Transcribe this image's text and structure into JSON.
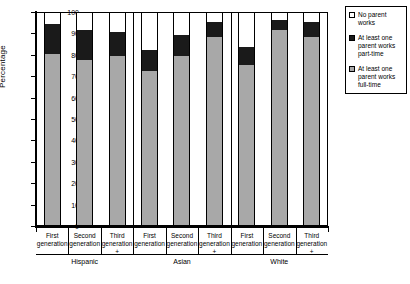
{
  "chart_data": {
    "type": "bar",
    "title": "",
    "subtitle": "",
    "xlabel": "",
    "ylabel": "Percentage",
    "ylim": [
      0,
      100
    ],
    "ytick_labels": [
      "0",
      "10",
      "20",
      "30",
      "40",
      "50",
      "60",
      "70",
      "80",
      "90",
      "100"
    ],
    "yticks": [
      0,
      10,
      20,
      30,
      40,
      50,
      60,
      70,
      80,
      90,
      100
    ],
    "grid": false,
    "stacked": true,
    "legend_position": "right",
    "groups": [
      "Hispanic",
      "Asian",
      "White"
    ],
    "categories": [
      "First generation",
      "Second generation",
      "Third generation +",
      "First generation",
      "Second generation",
      "Third generation +",
      "First generation",
      "Second generation",
      "Third generation +"
    ],
    "category_lines": [
      {
        "line1": "First",
        "line2": "generation",
        "plus": ""
      },
      {
        "line1": "Second",
        "line2": "generation",
        "plus": ""
      },
      {
        "line1": "Third",
        "line2": "generation",
        "plus": "+"
      },
      {
        "line1": "First",
        "line2": "generation",
        "plus": ""
      },
      {
        "line1": "Second",
        "line2": "generation",
        "plus": ""
      },
      {
        "line1": "Third",
        "line2": "generation",
        "plus": "+"
      },
      {
        "line1": "First",
        "line2": "generation",
        "plus": ""
      },
      {
        "line1": "Second",
        "line2": "generation",
        "plus": ""
      },
      {
        "line1": "Third",
        "line2": "generation",
        "plus": "+"
      }
    ],
    "series": [
      {
        "name": "At least one parent works full-time",
        "color": "#a8a8a8",
        "values": [
          80,
          77,
          79,
          72,
          79,
          88,
          75,
          91,
          88
        ]
      },
      {
        "name": "At least one parent works part-time",
        "color": "#1a1a1a",
        "values": [
          14,
          14,
          11,
          10,
          10,
          7,
          8,
          5,
          7
        ]
      },
      {
        "name": "No parent works",
        "color": "#ffffff",
        "values": [
          6,
          9,
          10,
          18,
          11,
          5,
          17,
          4,
          5
        ]
      }
    ],
    "stack_tops": {
      "full_time": [
        80,
        77,
        79,
        72,
        79,
        88,
        75,
        91,
        88
      ],
      "plus_part_time": [
        94,
        91,
        90,
        82,
        89,
        95,
        83,
        96,
        95
      ]
    }
  },
  "legend": {
    "items": [
      {
        "label": "No parent works",
        "swatch": "sw-none"
      },
      {
        "label": "At least one parent works part-time",
        "swatch": "sw-part"
      },
      {
        "label": "At least one parent works full-time",
        "swatch": "sw-full"
      }
    ]
  },
  "axis": {
    "y_title": "Percentage"
  }
}
